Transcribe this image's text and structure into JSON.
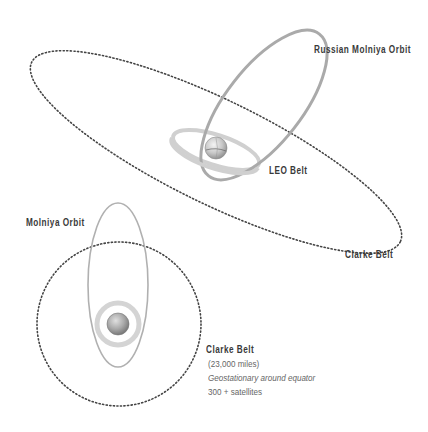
{
  "top_diagram": {
    "labels": {
      "russian_molniya": "Russian Molniya Orbit",
      "leo_belt": "LEO Belt",
      "clarke_belt": "Clarke Belt"
    }
  },
  "bottom_diagram": {
    "labels": {
      "molniya": "Molniya Orbit",
      "clarke_belt_title": "Clarke Belt",
      "clarke_belt_distance": "(23,000 miles)",
      "clarke_belt_desc": "Geostationary around equator",
      "clarke_belt_count": "300 + satellites"
    }
  },
  "colors": {
    "orbit_solid": "#aaaaaa",
    "leo_ring": "#cccccc",
    "dotted_orbit": "#444444",
    "label_text": "#3a3a3a",
    "note_text": "#666666"
  }
}
